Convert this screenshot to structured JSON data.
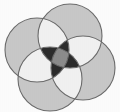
{
  "figure": {
    "title": "Four-circle Venn diagram",
    "background_color": "#fdfdfd",
    "width": 120,
    "height": 112
  },
  "palette": {
    "single_region": "#c9c9c9",
    "double_region": "#f2f2f2",
    "triple_region": "#2b2b2b",
    "quad_region": "#8c8c8c",
    "outline": "#6b6b6b",
    "background": "#fdfdfd"
  },
  "chart_data": {
    "type": "venn",
    "title": "Four-circle Venn diagram",
    "set_count": 4,
    "circles": [
      {
        "id": "A",
        "label": "left",
        "cx": 37,
        "cy": 50,
        "r": 32,
        "fill": "#c9c9c9"
      },
      {
        "id": "B",
        "label": "top",
        "cx": 70,
        "cy": 36,
        "r": 32,
        "fill": "#c9c9c9"
      },
      {
        "id": "C",
        "label": "right",
        "cx": 83,
        "cy": 68,
        "r": 32,
        "fill": "#c9c9c9"
      },
      {
        "id": "D",
        "label": "bottom",
        "cx": 50,
        "cy": 79,
        "r": 32,
        "fill": "#c9c9c9"
      }
    ],
    "region_shading": [
      {
        "sets": 1,
        "tone": "light gray",
        "hex": "#c9c9c9"
      },
      {
        "sets": 2,
        "tone": "near white",
        "hex": "#f2f2f2"
      },
      {
        "sets": 3,
        "tone": "near black",
        "hex": "#2b2b2b"
      },
      {
        "sets": 4,
        "tone": "medium gray",
        "hex": "#8c8c8c"
      }
    ],
    "legend": [],
    "annotations": []
  }
}
